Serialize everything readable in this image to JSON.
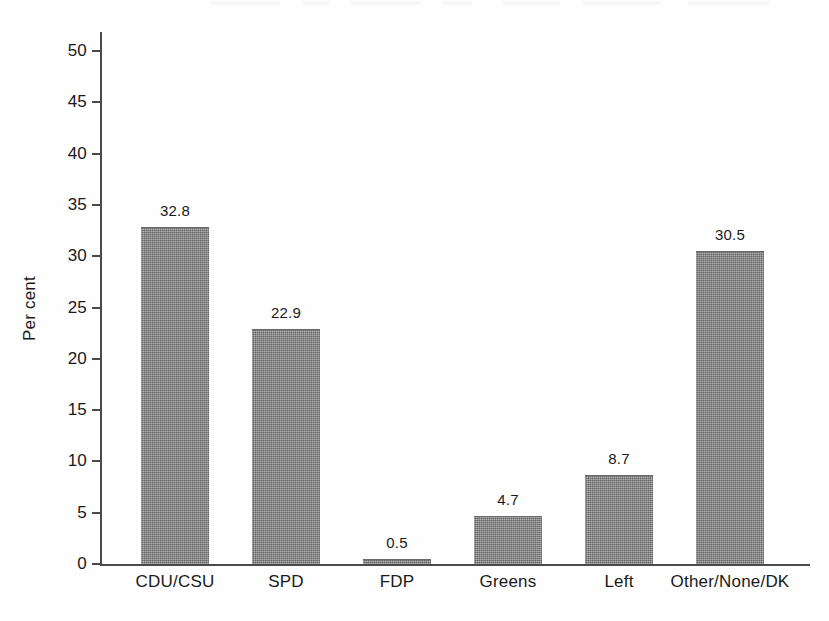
{
  "figure": {
    "background_color": "#fefefe",
    "bar_color": "#808080",
    "axis_color": "#4a4a4a",
    "text_color": "#1a1a1a"
  },
  "chart_data": {
    "type": "bar",
    "title": "",
    "subtitle": "",
    "xlabel": "",
    "ylabel": "Per cent",
    "categories": [
      "CDU/CSU",
      "SPD",
      "FDP",
      "Greens",
      "Left",
      "Other/None/DK"
    ],
    "values": [
      32.8,
      22.9,
      0.5,
      4.7,
      8.7,
      30.5
    ],
    "value_labels": [
      "32.8",
      "22.9",
      "0.5",
      "4.7",
      "8.7",
      "30.5"
    ],
    "ylim": [
      0,
      50
    ],
    "ytick_values": [
      0,
      5,
      10,
      15,
      20,
      25,
      30,
      35,
      40,
      45,
      50
    ],
    "ytick_labels": [
      "0",
      "5",
      "10",
      "15",
      "20",
      "25",
      "30",
      "35",
      "40",
      "45",
      "50"
    ],
    "grid": false,
    "legend": false,
    "legend_position": "none",
    "orientation": "vertical",
    "value_labels_shown": true
  }
}
